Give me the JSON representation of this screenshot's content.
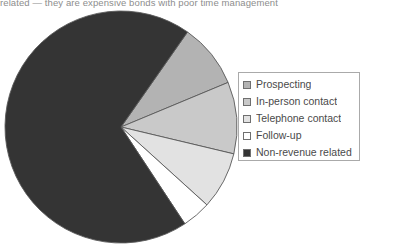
{
  "caption": {
    "text": "related — they are expensive bonds with poor time management"
  },
  "legend": {
    "position": "right",
    "items": [
      {
        "label": "Prospecting",
        "color": "#b3b3b3",
        "swatch": "legend-swatch-prospecting"
      },
      {
        "label": "In-person contact",
        "color": "#c9c9c9",
        "swatch": "legend-swatch-in-person-contact"
      },
      {
        "label": "Telephone contact",
        "color": "#e2e2e2",
        "swatch": "legend-swatch-telephone-contact"
      },
      {
        "label": "Follow-up",
        "color": "#ffffff",
        "swatch": "legend-swatch-follow-up"
      },
      {
        "label": "Non-revenue related",
        "color": "#343434",
        "swatch": "legend-swatch-non-revenue-related"
      }
    ]
  },
  "chart_data": {
    "type": "pie",
    "title": "",
    "subtitle": "",
    "xlabel": "",
    "ylabel": "",
    "grid": false,
    "legend_position": "right",
    "start_angle": -55,
    "direction": "clockwise",
    "center": {
      "x": 121,
      "y": 127
    },
    "radius": 116,
    "categories": [
      "Prospecting",
      "In-person contact",
      "Telephone contact",
      "Follow-up",
      "Non-revenue related"
    ],
    "values": [
      9,
      10,
      8,
      4,
      69
    ],
    "colors": [
      "#b3b3b3",
      "#c9c9c9",
      "#e2e2e2",
      "#ffffff",
      "#343434"
    ],
    "slices": [
      {
        "label": "Prospecting",
        "value": 9,
        "color": "#b3b3b3",
        "start_deg": -55,
        "end_deg": -22.6
      },
      {
        "label": "In-person contact",
        "value": 10,
        "color": "#c9c9c9",
        "start_deg": -22.6,
        "end_deg": 13.4
      },
      {
        "label": "Telephone contact",
        "value": 8,
        "color": "#e2e2e2",
        "start_deg": 13.4,
        "end_deg": 42.2
      },
      {
        "label": "Follow-up",
        "value": 4,
        "color": "#ffffff",
        "start_deg": 42.2,
        "end_deg": 56.6
      },
      {
        "label": "Non-revenue related",
        "value": 69,
        "color": "#343434",
        "start_deg": 56.6,
        "end_deg": 305
      }
    ],
    "stroke_color": "#5a5a5a",
    "total": 100
  }
}
